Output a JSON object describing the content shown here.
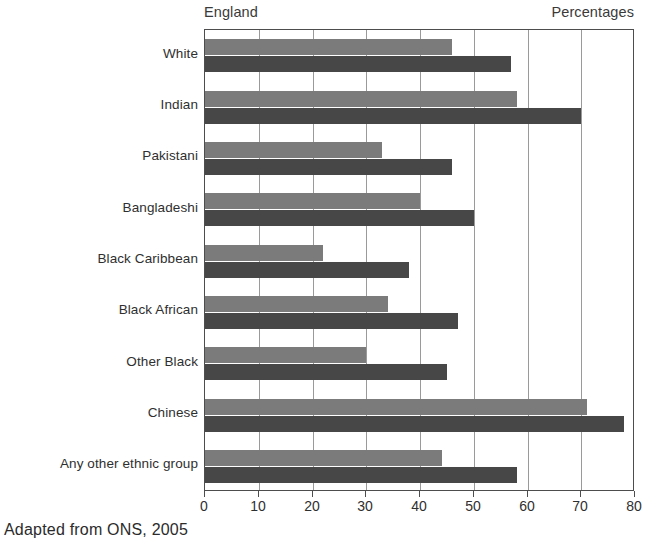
{
  "header": {
    "region_label": "England",
    "units_label": "Percentages"
  },
  "caption": "Adapted from ONS, 2005",
  "legend": {
    "position": "inside-right",
    "entries": [
      {
        "label": "Boys",
        "color": "#7b7b7b"
      },
      {
        "label": "Girls",
        "color": "#474747"
      }
    ]
  },
  "chart_data": {
    "type": "bar",
    "orientation": "horizontal",
    "title": "England",
    "subtitle": "",
    "xlabel": "Percentages",
    "ylabel": "",
    "xlim": [
      0,
      80
    ],
    "xticks": [
      0,
      10,
      20,
      30,
      40,
      50,
      60,
      70,
      80
    ],
    "xticklabels": [
      "0",
      "10",
      "20",
      "30",
      "40",
      "50",
      "60",
      "70",
      "80"
    ],
    "grid": "vertical",
    "legend_position": "inside-right",
    "categories": [
      "White",
      "Indian",
      "Pakistani",
      "Bangladeshi",
      "Black Caribbean",
      "Black African",
      "Other Black",
      "Chinese",
      "Any other ethnic group"
    ],
    "series": [
      {
        "name": "Boys",
        "color": "#7b7b7b",
        "values": [
          46,
          58,
          33,
          40,
          22,
          34,
          30,
          71,
          44
        ]
      },
      {
        "name": "Girls",
        "color": "#474747",
        "values": [
          57,
          70,
          46,
          50,
          38,
          47,
          45,
          78,
          58
        ]
      }
    ],
    "source_note": "Adapted from ONS, 2005"
  }
}
